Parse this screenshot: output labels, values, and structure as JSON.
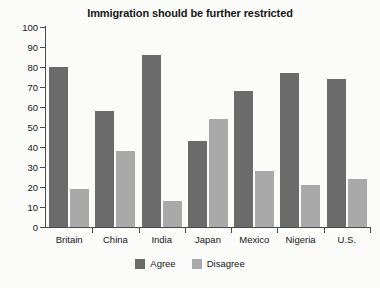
{
  "chart_data": {
    "type": "bar",
    "title": "Immigration should be further restricted",
    "xlabel": "",
    "ylabel": "",
    "ylim": [
      0,
      100
    ],
    "yticks": [
      0,
      10,
      20,
      30,
      40,
      50,
      60,
      70,
      80,
      90,
      100
    ],
    "grid": false,
    "legend_position": "bottom",
    "categories": [
      "Britain",
      "China",
      "India",
      "Japan",
      "Mexico",
      "Nigeria",
      "U.S."
    ],
    "series": [
      {
        "name": "Agree",
        "color": "#6b6b6b",
        "values": [
          80,
          58,
          86,
          43,
          68,
          77,
          74
        ]
      },
      {
        "name": "Disagree",
        "color": "#a9a9a9",
        "values": [
          19,
          38,
          13,
          54,
          28,
          21,
          24
        ]
      }
    ]
  }
}
